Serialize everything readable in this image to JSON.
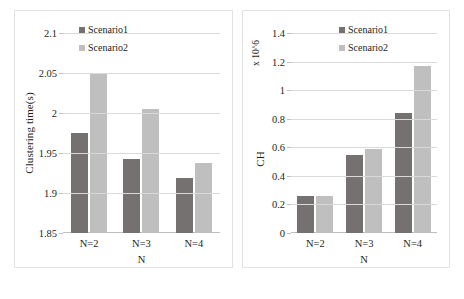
{
  "figure": {
    "background": "#ffffff",
    "series_colors": {
      "scenario1": "#767171",
      "scenario2": "#bfbfbf"
    },
    "grid_color": "#d9d9d9"
  },
  "legend": {
    "scenario1": "Scenario1",
    "scenario2": "Scenario2"
  },
  "panels": {
    "left": {
      "ylabel": "Clustering time(s)",
      "xlabel": "N",
      "yticks": [
        "1.85",
        "1.9",
        "1.95",
        "2",
        "2.05",
        "2.1"
      ],
      "xticks": [
        "N=2",
        "N=3",
        "N=4"
      ]
    },
    "right": {
      "ylabel": "CH",
      "exponent": "x 10^6",
      "xlabel": "N",
      "yticks": [
        "0",
        "0.2",
        "0.4",
        "0.6",
        "0.8",
        "1",
        "1.2",
        "1.4"
      ],
      "xticks": [
        "N=2",
        "N=3",
        "N=4"
      ]
    }
  },
  "chart_data": [
    {
      "type": "bar",
      "title": "",
      "xlabel": "N",
      "ylabel": "Clustering time(s)",
      "categories": [
        "N=2",
        "N=3",
        "N=4"
      ],
      "series": [
        {
          "name": "Scenario1",
          "color": "#767171",
          "values": [
            1.975,
            1.943,
            1.919
          ]
        },
        {
          "name": "Scenario2",
          "color": "#bfbfbf",
          "values": [
            2.05,
            2.005,
            1.938
          ]
        }
      ],
      "ylim": [
        1.85,
        2.1
      ],
      "yticks": [
        1.85,
        1.9,
        1.95,
        2,
        2.05,
        2.1
      ],
      "grid": true,
      "legend_position": "top-left"
    },
    {
      "type": "bar",
      "title": "",
      "xlabel": "N",
      "ylabel": "CH",
      "y_exponent": "x 10^6",
      "categories": [
        "N=2",
        "N=3",
        "N=4"
      ],
      "series": [
        {
          "name": "Scenario1",
          "color": "#767171",
          "values": [
            0.26,
            0.545,
            0.84
          ]
        },
        {
          "name": "Scenario2",
          "color": "#bfbfbf",
          "values": [
            0.26,
            0.59,
            1.17
          ]
        }
      ],
      "ylim": [
        0,
        1.4
      ],
      "yticks": [
        0,
        0.2,
        0.4,
        0.6,
        0.8,
        1,
        1.2,
        1.4
      ],
      "grid": true,
      "legend_position": "top-left"
    }
  ]
}
